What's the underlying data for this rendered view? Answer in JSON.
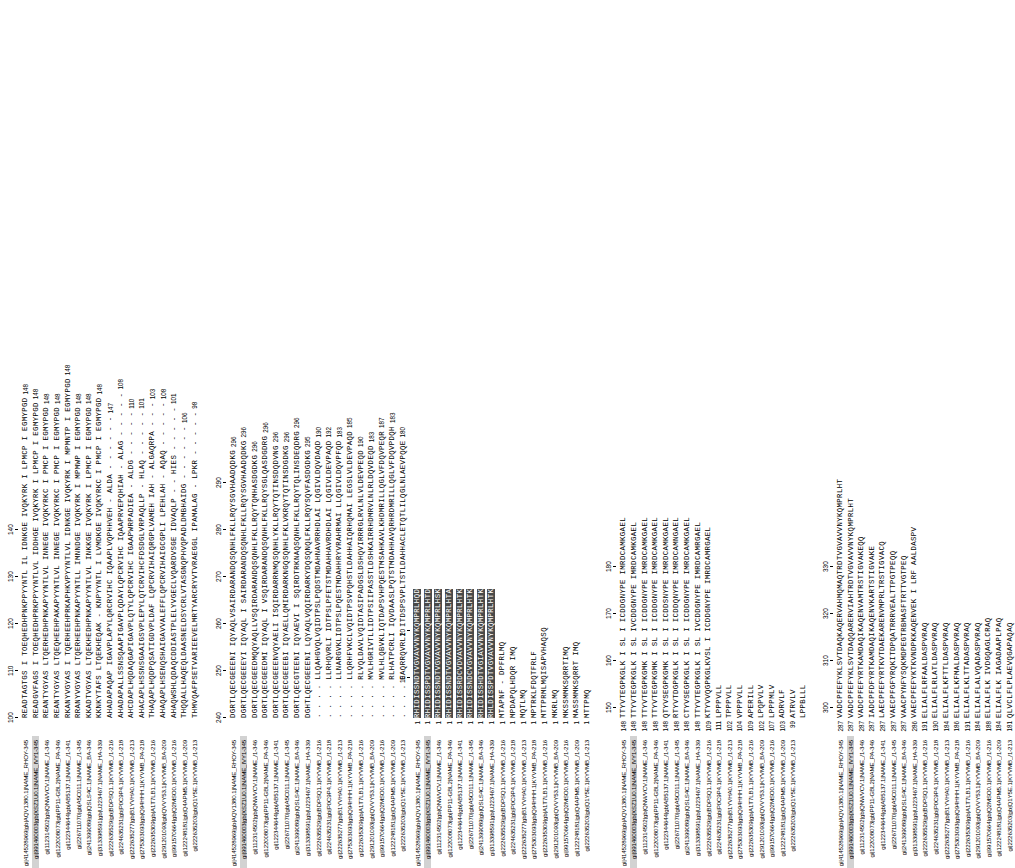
{
  "figure": {
    "type": "multiple-sequence-alignment",
    "orientation": "rotated-90-ccw",
    "font": "monospace",
    "panels": [
      "upper",
      "lower"
    ],
    "n_sequences_upper": 17,
    "n_sequences_lower": 17
  },
  "names": [
    "gi|414528969|gb|AQV1380.1|NAME_RHOY-345",
    "gi|991460003|gb|XSZ1U0.1|NAME_IVY1-345",
    "gi|112314502|gb|QNWVCV.1|NAME_/1-346",
    "gi|122008073|gb|PP11-GBL2|NAME_PA-346",
    "gi|122344644|gb|AB5137.1|NAME_/1-341",
    "gi|226711070|gb|A5C011.1|NAME_/1-345",
    "gi|241399089|gb|QSLS4C.1|NAME_BA-346",
    "gi|313398591|gb|U223467.1|NAME_HA-339",
    "gi|222635529|gb|BDPSQ1.1|KYVMB_/1-216",
    "gi|224635231|gb|P0C9P4.1|KYVMB_/1-218",
    "gi|222635277|gb|B1YVHA0.1|KYVMB_/1-213",
    "gi|275303093|gb|Q94HHH.1|KYVMB_PA-218",
    "gi|222635309|gb|A1T7LB1.1|KYVMB_/1-216",
    "gi|291201093|gb|QVVY53.1|KYVMB_BA-209",
    "gi|991570664|gb|Q2MSO0.1|KYVMB_/1-216",
    "gi|122248181|gb|Q4APM5.1|KYVMB_/1-209",
    "gi|222635203|gb|Q1Y5E.1|KYVMB_/1-213"
  ],
  "upper_panel": {
    "blocks": [
      {
        "id": "block-u1",
        "range": [
          95,
          148
        ],
        "ticks": [
          100,
          110,
          120,
          130,
          140
        ],
        "start_numbers": [
          "",
          "",
          "",
          "",
          "",
          "",
          "",
          "",
          "",
          "",
          "",
          "",
          "",
          "",
          "",
          "",
          ""
        ],
        "end_numbers": [
          "148",
          "148",
          "148",
          "148",
          "148",
          "148",
          "148",
          "148",
          "147",
          "108",
          "110",
          "101",
          "103",
          "108",
          "101",
          "106",
          "98"
        ],
        "sequences": [
          "READTAGTGS I TOEQHEDHPNKPPYYNTL IL IDNKGE IVQKYRK I LPMCP I EGMYPGD",
          "READGVFAGS I TOEQHEDHPRKPPYYNTLVL IDDHGE IVQKYRK I LPMCP I EGMYPGD",
          "REANTYGYAS LTQERHEDHPNKAPYYNTLVL INNEGE IVQKYRKC I PMCP I EGMYPGD",
          "REANTYGYAS LTQEQHEEHPAKAPYYNTLVL INNEGE IVQKYRKC I PMCP I EGMYPGD",
          "RKANYVGYAS I TQERHEEHPRKAPHKVPYYNTLVL IDNKGE IVQKYRK I MPMNTP I EGMYPGD",
          "RRANYVGYAS LTQERHEEHPNKAPYYNTLL IMNNDGE IVQKYRK I MPMWP I EGMYPGD",
          "KKADTVGYAS LTQEKHEDHPNKAPYYNTLVL INKKGE IVQKYRK I LPMCP I EGMYPGD",
          "KKNKYTAFS LTQEKHEQAK - KNPYYNTL I LVMDKGE IVQKYRKC I PMCP I EGMYPGD",
          "AHADAPAQAP IGAVPLAPYLQRCRVIHC IQAAPLVQPHHVEH - ALDA - - - - - -",
          "AHADAPALLSSNSQAAPIGAVPLQDAYLQPCRVIHC IQAAPRVEPQHIAH - ALAG - - - - -",
          "AHCDAPLHQDAQGAPIGAVPLQTYLQPCRVIHC IGAAPWRPADIEA - ALDG - - - - -",
          "AHACAPLHSSNSGAAIGSVPLEPYLQTCRVIHCFDSDGLVRPAQLLP - HLAQ - - - - -",
          "THAQAPLHQDPQSATIGDVPLDAF LQPCRVIHAIQRGPLVAMEH IAH - ALGAQRPA - - -",
          "AHAQAPLHSENQSHAIGAVVALEFFLQPCRVIHAIGCGPLI LPEHLAH - AQAQ - - - - -",
          "AHAQWSHLQDAQCDDIASTPLELYVGECLVQARDVSGE IDVAQLP - - HIES - - - - -",
          "THQQALLHAQEQLDAASNELDSYCRLVTASGNQPHVQPADLDMBHAIDG - - - - - -",
          "THMVQAFPSETVARIEEVELMRTYARCRYVTVRAEGGL IPAMALAG - LPKR - - - - -"
        ]
      },
      {
        "id": "block-u2",
        "range": [
          240,
          296
        ],
        "ticks": [
          240,
          250,
          260,
          270,
          280,
          290
        ],
        "end_numbers": [
          "296",
          "296",
          "296",
          "296",
          "296",
          "296",
          "296",
          "295",
          "190",
          "192",
          "183",
          "185",
          "190",
          "183",
          "187",
          "183",
          "180"
        ],
        "sequences": [
          "DGRTLQECGEEENI IQYAQLVSAIRDARANDQSQNHLFKLLRQYSGVHAADQDKG",
          "DGRTLQECGEEEYI IQYAQL I SAIRDARANDQSQNHLFKLLRQYSGVHAADQDKG",
          "DGRTLQECGEEDMQQYAQLLVSQIRDARANDQSQNHLFKLLRQYTQMHASDGDKG",
          "DGRTLQECGEEDMI IQYAQL I VSQIRDARANDQSQNHLFKLLRQYSGLQASDGDRG",
          "DGRTLQECGEEENVQYAELI ISQIRDARRNMQSQNHLYKLLRQYTQTINSDQDVNG",
          "DGRTLQECGEEEBI IQYAELLQMIRDARKNGQSQNHLFKLVKRQYTQTINSDGDKG",
          "DGRTLQECGTEENI IQYAEVI I SQIRDTRKNAQSQNHLFKLLRQYTQLINSDEQDRG",
          "DGHTLQECGEEENI LQYAQLVQQIRDARKYDQSQNQLFKLLRQYSQVFASDGDKG",
          ". . . . LLQAHGVQLVQIDTPSLPQDSTMDAHNAVRRHDLAI LQGIVLDQVDAQD",
          ". . . . LLRHQVRLI IDTPSLPFETSTMDAHHAVRDHDLAI LQGIVLDEVPAQD",
          ". . . . LLNARGVKLIDTPSLPQESTMDAHHRYVRAHRMAI LLQGIVLDQVPFQD",
          ". . . . LLQRHFVKCLVQIDTPSVPQHSTLDAHHAIQRHQMAI LEGSLVLDEVPAQD",
          ". . . . RLVQLDAVLVQIDTASIPADGSLDSHQVIRRRGLRVLNLVLDEVPEQD",
          ". . . . MVLHGRIVTLLIDTPSIIPASSTLDSHKAIRRHDMRVLNLRLDQVDEQD",
          ". . . . MVLHLQBVKLIQTDAPSVHPQESTMSAHKAVLKHDMRILLQGLVFDQVPEQR",
          ". . . . RLHATPCRLI IQVDAASLPQTSTMDAHHAVQRHRDMRILLQGLVFDQVPDQH",
          ". . . . EAQRRQVRLI ITDSPSVPLTSTLDAHHACLETQTLILQGLNLAEVPQQE"
        ]
      }
    ]
  },
  "lower_panel": {
    "blocks": [
      {
        "id": "block-l1",
        "range": [
          1,
          28
        ],
        "ticks": [
          10,
          20
        ],
        "start_numbers": [
          "1",
          "1",
          "1",
          "1",
          "1",
          "1",
          "1",
          "1",
          "1",
          "1",
          "1",
          "1",
          "1",
          "1",
          "1",
          "1",
          "1"
        ],
        "end_numbers": [
          "",
          "",
          "",
          "",
          "",
          "",
          "",
          "",
          "",
          "",
          "",
          "",
          "",
          "",
          "",
          "",
          ""
        ],
        "sequences": [
          "RHIDISSNDTVGVAVVNYKQMPRLHQD",
          "RHIDISSPDTVGVAVVNYKQMPRLHTD",
          "RHIDISSNDTVGVAVVNYKQMPRLHSK",
          "RHIDISSNDTVGVAVVNYKQMPRLHTA",
          "RHIDISSRDCVDVAVVNYKQMPRLHTK",
          "RHIDISSNDCVGVAVVNYKQMPRLHTK",
          "RHIDISSHDTVGIAVVNYKQMPRLHTK",
          "RHLDISSPDTVGVAVVNYKQMPRLHTK",
          "MTAPNF - DPFRLMQ",
          "MPDAPQLHDQR IMQ",
          "MQTLMQ",
          "MPTRKLFDQTFRLF",
          "MTTPRMLMQISAPVHAQSQ",
          "MKRLMQ",
          "MKSSMMKSQRRTIMQ",
          "MASSMMKSQRRT IMQ",
          "MTTPMQ"
        ]
      },
      {
        "id": "block-l2",
        "range": [
          148,
          186
        ],
        "ticks": [
          150,
          160,
          170,
          180
        ],
        "start_numbers": [
          "148",
          "148",
          "148",
          "148",
          "148",
          "148",
          "148",
          "148",
          "109",
          "111",
          "102",
          "104",
          "109",
          "102",
          "107",
          "103",
          "99"
        ],
        "sequences": [
          "TTYVTEGPKGLK I SL I ICDDGNYPE IMRDCAMKGAEL",
          "TTYVTEGPKGLK I SL IVCDDGNYPE IMRDCAMKGAEL",
          "TTYVTEGPKGMK I SL I ICDDGNYPE IMRDCAMKGAEL",
          "TTYVTEGPKGMK I SL I ICDDGNYPE IMRDCAMKGAEL",
          "QTYVSEGPKGMK I SL I ICDDSNYPE IMRDCAMKGAEL",
          "RTYVTDGPKGLK I SL I ICDDQNYPE IMRDCAMNGAEL",
          "CTYVSEGPKGLK I SL I ICDDGNYPE IMRDCAMKGAEL",
          "TTYVTEGPKGLK I SL IVCDDGNYPE IMRDCAMRGAEL",
          "KTYVVQGPKGLKVSL I ICDDGNYPE IMRDCAMRGAEL",
          "LPPPVLL",
          "TPPPVLL",
          "VPPPVLL",
          "APERILL",
          "LPQPVLV",
          "LPPPMLV",
          "ADRVLF",
          "ATRVLV",
          "LPPBLLL"
        ]
      },
      {
        "id": "block-l3",
        "range": [
          287,
          330
        ],
        "ticks": [
          300,
          310,
          320,
          330
        ],
        "start_numbers": [
          "287",
          "287",
          "287",
          "287",
          "287",
          "287",
          "287",
          "286",
          "191",
          "190",
          "184",
          "186",
          "191",
          "184",
          "188",
          "184",
          "181"
        ],
        "sequences": [
          "VADCPFEFYKLSVTDAQKAQERVAHMQMAQTRDTVGVAVVNYKQMPRLHT",
          "VADCPFEFYKLSVTDAQQARERVIAHTRDTVGVAVVNYKQMPRLHT",
          "VADCPFEFYRTKAMDAQIKAQENVAMTRSTIGVAKEQQ",
          "IADCPFDFYRTKAMDAQIKAQENVKARTSTIGVAKE",
          "LAECPFEFYRTKVTDAEKARENVMPRLTRSTIGVACQ",
          "VAECPFGFYRQKITDPQATRRRVEALTTPGTPEQQ",
          "VAACPYNFYSQKMDPEGTRBMASFTRTTVGTPEQ",
          "VAECPFEFYKTKVNDPKKAQENVEK I LRF AALDASPV",
          "ELIALFLRFAALDASPVRAQ",
          "ELIALFLRLATLDASPVRAQ",
          "ELIALFLKFTTLDASPVRAQ",
          "ELIALFLKFMALDASPVRAQ",
          "ELIALFLKLTTADASPVRAQ",
          "ELIALFLALVQADASPVRAQ",
          "ELIALFLK IVDGQAGLCRAQ",
          "ELIALFLK IAGADAAPLPAQ",
          "QLVCLFLPLAEVQGAPAQAQ"
        ]
      }
    ]
  },
  "colors": {
    "dark": "#4a4a4a",
    "mid": "#8f8f8f",
    "light": "#c9c9c9",
    "name_highlight": "#d2d2d2",
    "text": "#000000",
    "background": "#ffffff"
  }
}
